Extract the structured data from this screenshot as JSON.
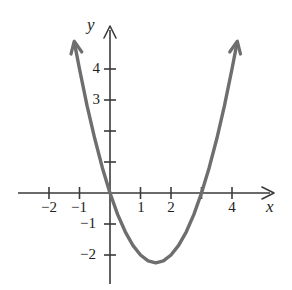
{
  "figure": {
    "kind": "cartesian-graph",
    "background_color": "#ffffff",
    "curve_color": "#6e6e6e",
    "axis_color": "#3a3a3a",
    "text_color": "#231f20"
  },
  "axes": {
    "x_label": "x",
    "y_label": "y",
    "x_ticks": [
      {
        "value": -2,
        "label": "−2"
      },
      {
        "value": -1,
        "label": "−1"
      },
      {
        "value": 1,
        "label": "1"
      },
      {
        "value": 2,
        "label": "2"
      },
      {
        "value": 3,
        "label": ""
      },
      {
        "value": 4,
        "label": "4"
      }
    ],
    "y_ticks": [
      {
        "value": 4,
        "label": "4"
      },
      {
        "value": 3,
        "label": "3"
      },
      {
        "value": 2,
        "label": ""
      },
      {
        "value": 1,
        "label": ""
      },
      {
        "value": -1,
        "label": "−1"
      },
      {
        "value": -2,
        "label": "−2"
      }
    ]
  },
  "chart_data": {
    "type": "line",
    "title": "",
    "xlabel": "x",
    "ylabel": "y",
    "xlim": [
      -2.9,
      5.1
    ],
    "ylim": [
      -3.1,
      5.0
    ],
    "grid": false,
    "legend": "none",
    "series": [
      {
        "name": "parabola",
        "equation": "y = x^2 - 3x",
        "vertex": [
          1.5,
          -2.25
        ],
        "roots": [
          0,
          3
        ],
        "color": "#6e6e6e",
        "arrow_ends": [
          "left-up",
          "right-up"
        ],
        "x": [
          -1.15,
          -1.0,
          -0.75,
          -0.5,
          -0.25,
          0,
          0.25,
          0.5,
          0.75,
          1.0,
          1.25,
          1.5,
          1.75,
          2.0,
          2.25,
          2.5,
          2.75,
          3.0,
          3.25,
          3.5,
          3.75,
          4.0,
          4.15
        ],
        "values": [
          4.77,
          4.0,
          2.81,
          1.75,
          0.81,
          0,
          -0.69,
          -1.25,
          -1.69,
          -2.0,
          -2.19,
          -2.25,
          -2.19,
          -2.0,
          -1.69,
          -1.25,
          -0.69,
          0,
          0.81,
          1.75,
          2.81,
          4.0,
          4.77
        ]
      }
    ]
  },
  "geometry": {
    "origin_px": [
      110,
      193
    ],
    "unit_px_x": 30.5,
    "unit_px_y": 31.0
  }
}
